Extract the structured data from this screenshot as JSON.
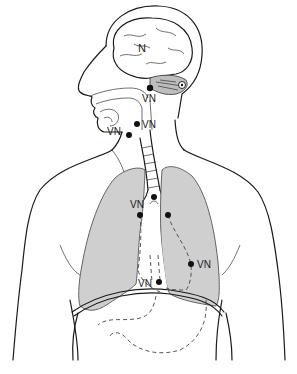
{
  "diagram": {
    "colors": {
      "lung_fill": "#cfcfcf",
      "cerebellum_fill": "#bdbdbd",
      "line": "#1a1a1a",
      "background": "#ffffff"
    },
    "labels": {
      "brain": "N",
      "brainstem": "VN",
      "pharynx": "VN",
      "larynx": "VN",
      "carina": "VN",
      "right_lung_upper": "VN",
      "left_lung_lower": "VN",
      "heart_region": "VN"
    },
    "nodes": [
      {
        "id": "brainstem",
        "x": 150,
        "y": 88
      },
      {
        "id": "pharynx",
        "x": 137,
        "y": 124
      },
      {
        "id": "larynx",
        "x": 129,
        "y": 134
      },
      {
        "id": "carina",
        "x": 154,
        "y": 197
      },
      {
        "id": "right-bronchus",
        "x": 140,
        "y": 215
      },
      {
        "id": "left-bronchus",
        "x": 168,
        "y": 215
      },
      {
        "id": "left-lung-lower",
        "x": 191,
        "y": 264
      },
      {
        "id": "heart-region",
        "x": 159,
        "y": 282
      }
    ]
  }
}
